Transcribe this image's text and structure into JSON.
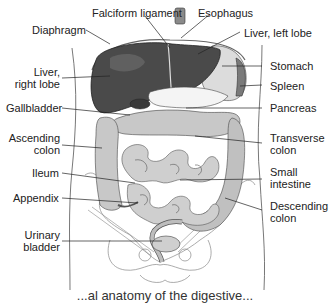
{
  "diagram": {
    "type": "anatomical-illustration",
    "colors": {
      "liver": "#4a4a4a",
      "liver_highlight": "#6a6a6a",
      "stomach": "#dcdcdc",
      "spleen": "#7a7a7a",
      "pancreas": "#f2f2f2",
      "intestine": "#c8c8c8",
      "intestine_dark": "#9a9a9a",
      "outline": "#333333",
      "body_outline": "#555555",
      "pelvis": "#888888",
      "bladder": "#cfcfcf"
    },
    "labels": {
      "falciform_ligament": "Falciform ligament",
      "esophagus": "Esophagus",
      "diaphragm": "Diaphragm",
      "liver_left_lobe": "Liver, left lobe",
      "liver_right_lobe": "Liver,\nright lobe",
      "stomach": "Stomach",
      "spleen": "Spleen",
      "gallbladder": "Gallbladder",
      "pancreas": "Pancreas",
      "ascending_colon": "Ascending\ncolon",
      "transverse_colon": "Transverse\ncolon",
      "ileum": "Ileum",
      "small_intestine": "Small\nintestine",
      "appendix": "Appendix",
      "descending_colon": "Descending\ncolon",
      "urinary_bladder": "Urinary\nbladder"
    },
    "caption": "...al anatomy of the digestive..."
  }
}
